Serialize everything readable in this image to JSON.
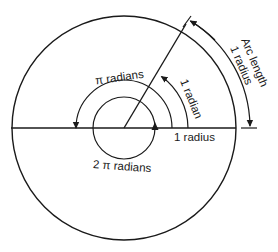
{
  "diagram": {
    "type": "geometry-diagram",
    "labels": {
      "pi_radians": "π radians",
      "one_radian": "1 radian",
      "one_radius": "1 radius",
      "two_pi_radians": "2 π radians",
      "arc_length_line1": "Arc length",
      "arc_length_line2": "1 radius"
    },
    "colors": {
      "stroke": "#1a1a1a",
      "background": "#ffffff"
    },
    "geometry": {
      "center": [
        124,
        128
      ],
      "main_circle_radius": 112,
      "inner_circle_radius": 31,
      "pi_arc_radius": 48,
      "one_radian_arc_radius": 64,
      "arc_length_arrow_radius": 126,
      "radius_line_angle_deg": 57.3
    }
  }
}
